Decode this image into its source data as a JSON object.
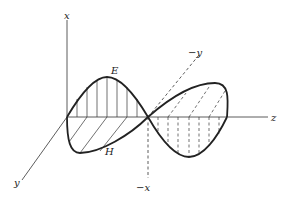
{
  "figure": {
    "type": "electromagnetic-wave-3d-sketch",
    "labels": {
      "x_axis": "x",
      "neg_x_axis": "−x",
      "y_axis": "y",
      "neg_y_axis": "−y",
      "z_axis": "z",
      "e_field": "E",
      "h_field": "H"
    },
    "colors": {
      "background": "#ffffff",
      "ink": "#222222"
    }
  }
}
